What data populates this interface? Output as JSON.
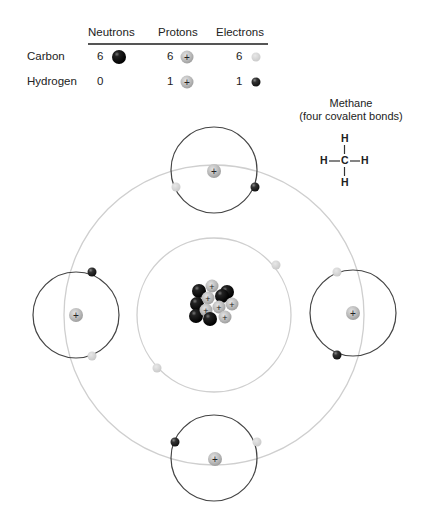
{
  "table": {
    "headers": [
      "Neutrons",
      "Protons",
      "Electrons"
    ],
    "rows": [
      {
        "element": "Carbon",
        "neutrons": "6",
        "protons": "6",
        "electrons": "6"
      },
      {
        "element": "Hydrogen",
        "neutrons": "0",
        "protons": "1",
        "electrons": "1"
      }
    ]
  },
  "molecule": {
    "title": "Methane",
    "subtitle": "(four covalent bonds)",
    "atoms": {
      "top": "H",
      "left": "H",
      "center": "C",
      "right": "H",
      "bottom": "H"
    }
  },
  "legend_colors": {
    "neutron": "#111111",
    "proton": "#b5b5b5",
    "carbon_electron": "#d6d6d6",
    "hydrogen_electron": "#2b2b2b"
  },
  "proton_symbol": "+",
  "diagram": {
    "outer_shell": {
      "cx": 214,
      "cy": 315,
      "r": 150,
      "color": "#cfcfcf"
    },
    "inner_shell": {
      "cx": 214,
      "cy": 315,
      "r": 77,
      "color": "#cfcfcf"
    },
    "hydrogen_orbits": [
      {
        "name": "top",
        "cx": 214,
        "cy": 170,
        "r": 43
      },
      {
        "name": "left",
        "cx": 76,
        "cy": 315,
        "r": 43
      },
      {
        "name": "right",
        "cx": 353,
        "cy": 313,
        "r": 43
      },
      {
        "name": "bottom",
        "cx": 214,
        "cy": 458,
        "r": 43
      }
    ],
    "orbit_color": "#444444"
  }
}
